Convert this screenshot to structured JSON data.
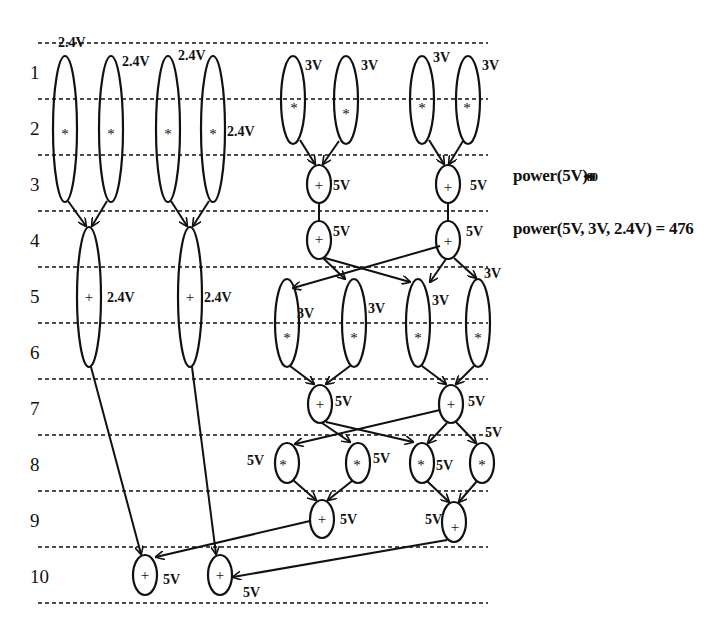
{
  "diagram": {
    "type": "scheduled data-flow graph with voltage assignment",
    "control_steps": [
      "1",
      "2",
      "3",
      "4",
      "5",
      "6",
      "7",
      "8",
      "9",
      "10"
    ],
    "colors": {
      "line": "#111111",
      "background": "#ffffff"
    },
    "nodes": [
      {
        "id": "a1",
        "op": "*",
        "voltage": "2.4V"
      },
      {
        "id": "a2",
        "op": "*",
        "voltage": "2.4V"
      },
      {
        "id": "a3",
        "op": "*",
        "voltage": "2.4V"
      },
      {
        "id": "a4",
        "op": "*",
        "voltage": "2.4V"
      },
      {
        "id": "l1",
        "op": "+",
        "voltage": "2.4V"
      },
      {
        "id": "l2",
        "op": "+",
        "voltage": "2.4V"
      },
      {
        "id": "m1",
        "op": "*",
        "voltage": "3V"
      },
      {
        "id": "m2",
        "op": "*",
        "voltage": "3V"
      },
      {
        "id": "m3",
        "op": "*",
        "voltage": "3V"
      },
      {
        "id": "m4",
        "op": "*",
        "voltage": "3V"
      },
      {
        "id": "r1",
        "op": "+",
        "voltage": "5V"
      },
      {
        "id": "r2",
        "op": "+",
        "voltage": "5V"
      },
      {
        "id": "r3",
        "op": "+",
        "voltage": "5V"
      },
      {
        "id": "r4",
        "op": "+",
        "voltage": "5V"
      },
      {
        "id": "n1",
        "op": "*",
        "voltage": "3V"
      },
      {
        "id": "n2",
        "op": "*",
        "voltage": "3V"
      },
      {
        "id": "n3",
        "op": "*",
        "voltage": "3V"
      },
      {
        "id": "n4",
        "op": "*",
        "voltage": "3V"
      },
      {
        "id": "s1",
        "op": "+",
        "voltage": "5V"
      },
      {
        "id": "s2",
        "op": "+",
        "voltage": "5V"
      },
      {
        "id": "p1",
        "op": "*",
        "voltage": "5V"
      },
      {
        "id": "p2",
        "op": "*",
        "voltage": "5V"
      },
      {
        "id": "p3",
        "op": "*",
        "voltage": "5V"
      },
      {
        "id": "p4",
        "op": "*",
        "voltage": "5V"
      },
      {
        "id": "t1",
        "op": "+",
        "voltage": "5V"
      },
      {
        "id": "t2",
        "op": "+",
        "voltage": "5V"
      },
      {
        "id": "f1",
        "op": "+",
        "voltage": "5V"
      },
      {
        "id": "f2",
        "op": "+",
        "voltage": "5V"
      }
    ]
  },
  "results": {
    "power_single": "power(5V)",
    "power_single_overstrike": "= 800",
    "power_multi": "power(5V, 3V, 2.4V) = 476"
  }
}
